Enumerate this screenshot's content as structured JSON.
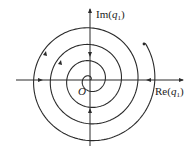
{
  "diagram": {
    "colors": {
      "stroke": "#2a2a2a",
      "background": "#ffffff"
    },
    "axes": {
      "x_label": {
        "prefix": "Re(",
        "var": "q",
        "sub": "1",
        "suffix": ")"
      },
      "y_label": {
        "prefix": "Im(",
        "var": "q",
        "sub": "1",
        "suffix": ")"
      },
      "origin_label": "O"
    },
    "axis_arrows": [
      {
        "position": "left",
        "direction": "right"
      },
      {
        "position": "right",
        "direction": "left"
      },
      {
        "position": "top",
        "direction": "down"
      },
      {
        "position": "bottom",
        "direction": "up"
      }
    ],
    "spiral": {
      "direction": "inward",
      "turns": 4
    }
  }
}
